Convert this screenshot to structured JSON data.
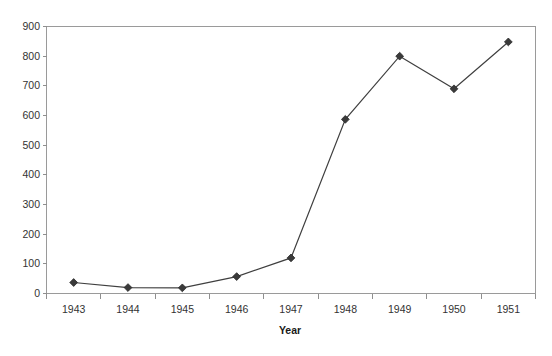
{
  "chart_data": {
    "type": "line",
    "title": "",
    "xlabel": "Year",
    "ylabel": "",
    "categories": [
      "1943",
      "1944",
      "1945",
      "1946",
      "1947",
      "1948",
      "1949",
      "1950",
      "1951"
    ],
    "values": [
      37,
      20,
      19,
      57,
      120,
      587,
      800,
      690,
      848
    ],
    "series": [
      {
        "name": "series-1",
        "values": [
          37,
          20,
          19,
          57,
          120,
          587,
          800,
          690,
          848
        ],
        "line_color": "#3f3f3f",
        "marker": "diamond",
        "marker_color": "#3a3a3a"
      }
    ],
    "ylim": [
      0,
      900
    ],
    "ytick_values": [
      0,
      100,
      200,
      300,
      400,
      500,
      600,
      700,
      800,
      900
    ],
    "ytick_labels": [
      "0",
      "100",
      "200",
      "300",
      "400",
      "500",
      "600",
      "700",
      "800",
      "900"
    ],
    "xtick_labels": [
      "1943",
      "1944",
      "1945",
      "1946",
      "1947",
      "1948",
      "1949",
      "1950",
      "1951"
    ],
    "grid": false,
    "legend": "none",
    "plot_background": "#ffffff",
    "frame_color": "#9a9a9a",
    "axis_text_color": "#333333"
  },
  "axis": {
    "x_title": "Year"
  }
}
